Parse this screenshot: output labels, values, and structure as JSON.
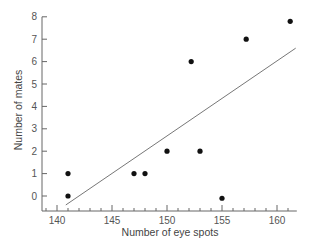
{
  "chart_data": {
    "type": "scatter",
    "title": "",
    "xlabel": "Number of eye spots",
    "ylabel": "Number of mates",
    "xlim": [
      138.6,
      161.8
    ],
    "ylim": [
      -0.6,
      8
    ],
    "xticks": [
      140,
      145,
      150,
      155,
      160
    ],
    "yticks": [
      0,
      1,
      2,
      3,
      4,
      5,
      6,
      7,
      8
    ],
    "grid": false,
    "legend": null,
    "points": [
      {
        "x": 141,
        "y": 1
      },
      {
        "x": 141,
        "y": 0
      },
      {
        "x": 147,
        "y": 1
      },
      {
        "x": 148,
        "y": 1
      },
      {
        "x": 150,
        "y": 2
      },
      {
        "x": 152.2,
        "y": 6
      },
      {
        "x": 153,
        "y": 2
      },
      {
        "x": 155,
        "y": -0.1
      },
      {
        "x": 157.2,
        "y": 7
      },
      {
        "x": 161.2,
        "y": 7.8
      }
    ],
    "trendline": {
      "x1": 140.8,
      "y1": -0.4,
      "x2": 161.7,
      "y2": 6.6
    }
  },
  "colors": {
    "axis": "#666666",
    "points": "#111111",
    "line": "#777777"
  }
}
